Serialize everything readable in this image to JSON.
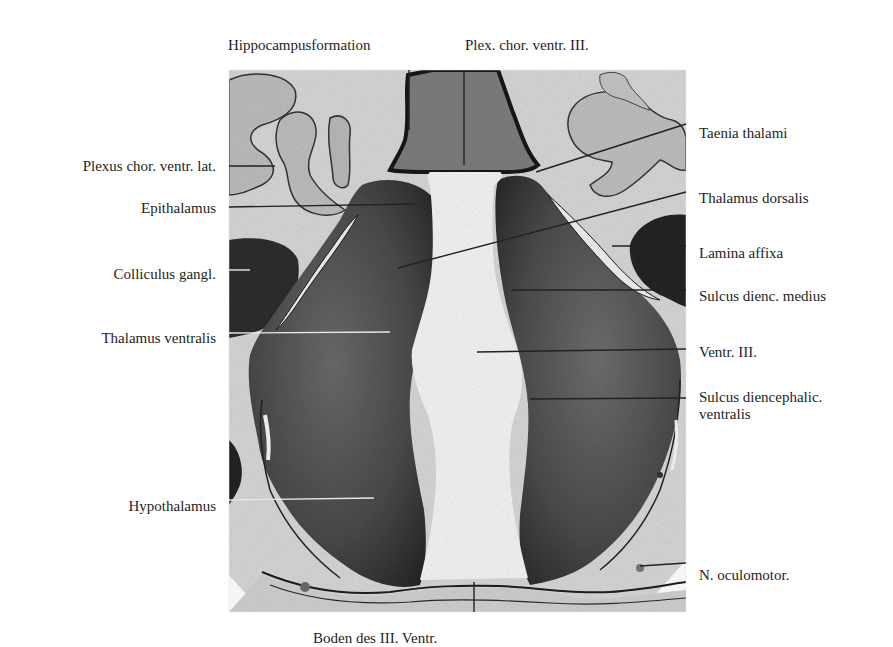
{
  "figure": {
    "type": "histological section, frontal cut through diencephalon",
    "labels": {
      "top": [
        {
          "id": "hippocampusformation",
          "text": "Hippocampusformation",
          "x": 228,
          "y": 37
        },
        {
          "id": "plex-chor-ventr-iii",
          "text": "Plex. chor. ventr. III.",
          "x": 465,
          "y": 37
        }
      ],
      "left": [
        {
          "id": "plexus-chor-ventr-lat",
          "text": "Plexus chor. ventr. lat.",
          "right": 216,
          "y": 158
        },
        {
          "id": "epithalamus",
          "text": "Epithalamus",
          "right": 216,
          "y": 200
        },
        {
          "id": "colliculus-gangl",
          "text": "Colliculus gangl.",
          "right": 216,
          "y": 266
        },
        {
          "id": "thalamus-ventralis",
          "text": "Thalamus ventralis",
          "right": 216,
          "y": 330
        },
        {
          "id": "hypothalamus",
          "text": "Hypothalamus",
          "right": 216,
          "y": 498
        }
      ],
      "right": [
        {
          "id": "taenia-thalami",
          "text": "Taenia thalami",
          "x": 699,
          "y": 125
        },
        {
          "id": "thalamus-dorsalis",
          "text": "Thalamus dorsalis",
          "x": 699,
          "y": 190
        },
        {
          "id": "lamina-affixa",
          "text": "Lamina affixa",
          "x": 699,
          "y": 245
        },
        {
          "id": "sulcus-dienc-medius",
          "text": "Sulcus dienc. medius",
          "x": 699,
          "y": 288
        },
        {
          "id": "ventr-iii",
          "text": "Ventr. III.",
          "x": 699,
          "y": 344
        },
        {
          "id": "sulcus-diencephalic-ventralis",
          "text": "Sulcus diencephalic.\nventralis",
          "x": 699,
          "y": 389
        },
        {
          "id": "n-oculomotor",
          "text": "N. oculomotor.",
          "x": 699,
          "y": 567
        }
      ],
      "bottom": [
        {
          "id": "boden-des-iii-ventr",
          "text": "Boden des III. Ventr.",
          "x": 313,
          "y": 630
        }
      ]
    },
    "leader_lines": [
      {
        "label": "hippocampusformation",
        "x1": 409,
        "y1": 70,
        "x2": 409,
        "y2": 130,
        "color": "#222222"
      },
      {
        "label": "plex-chor-ventr-iii",
        "x1": 464,
        "y1": 70,
        "x2": 464,
        "y2": 165,
        "color": "#222222"
      },
      {
        "label": "plexus-chor-ventr-lat",
        "x1": 229,
        "y1": 166,
        "x2": 275,
        "y2": 166,
        "color": "#222222"
      },
      {
        "label": "epithalamus",
        "x1": 229,
        "y1": 207,
        "x2": 415,
        "y2": 204,
        "color": "#222222"
      },
      {
        "label": "colliculus-gangl",
        "x1": 229,
        "y1": 270,
        "x2": 250,
        "y2": 270,
        "color": "#e8e8e8"
      },
      {
        "label": "thalamus-ventralis",
        "x1": 229,
        "y1": 333,
        "x2": 390,
        "y2": 332,
        "color": "#e8e8e8"
      },
      {
        "label": "hypothalamus",
        "x1": 229,
        "y1": 500,
        "x2": 374,
        "y2": 498,
        "color": "#e8e8e8"
      },
      {
        "label": "taenia-thalami",
        "x1": 686,
        "y1": 124,
        "x2": 536,
        "y2": 172,
        "color": "#222222"
      },
      {
        "label": "thalamus-dorsalis",
        "x1": 686,
        "y1": 192,
        "x2": 398,
        "y2": 268,
        "color": "#222222"
      },
      {
        "label": "lamina-affixa",
        "x1": 686,
        "y1": 246,
        "x2": 612,
        "y2": 246,
        "color": "#222222"
      },
      {
        "label": "sulcus-dienc-medius",
        "x1": 686,
        "y1": 290,
        "x2": 512,
        "y2": 290,
        "color": "#222222"
      },
      {
        "label": "ventr-iii",
        "x1": 686,
        "y1": 349,
        "x2": 477,
        "y2": 352,
        "color": "#222222"
      },
      {
        "label": "sulcus-diencephalic-ventralis",
        "x1": 686,
        "y1": 398,
        "x2": 530,
        "y2": 399,
        "color": "#222222"
      },
      {
        "label": "n-oculomotor",
        "x1": 686,
        "y1": 563,
        "x2": 640,
        "y2": 566,
        "color": "#222222"
      },
      {
        "label": "boden-des-iii-ventr",
        "x1": 474,
        "y1": 582,
        "x2": 474,
        "y2": 612,
        "color": "#222222"
      }
    ],
    "colors": {
      "background": "#ffffff",
      "section_background": "#d9d9d9",
      "tissue_dark": "#3a3a3a",
      "tissue_mid": "#5a5a5a",
      "ventricle": "#f2f2f2",
      "plexus": "#bdbdbd",
      "label_text": "#1e1e1e"
    }
  }
}
